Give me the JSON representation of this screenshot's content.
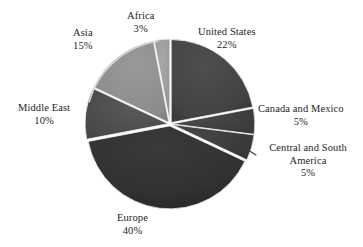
{
  "chart_data": {
    "type": "pie",
    "title": "",
    "subtitle": "",
    "xlabel": "",
    "ylabel": "",
    "legend_position": "none",
    "grid": false,
    "unit": "%",
    "style": "grayscale exploded pie with thin white separators",
    "background_color": "#ffffff",
    "label_text_color": "#1e1e1e",
    "categories": [
      "United States",
      "Canada and Mexico",
      "Central and South America",
      "Europe",
      "Middle East",
      "Asia",
      "Africa"
    ],
    "values": [
      22,
      5,
      5,
      40,
      10,
      15,
      3
    ],
    "slices": [
      {
        "label": "United States",
        "value": 22,
        "value_text": "22%",
        "color": "#434343",
        "start_angle": 0,
        "end_angle": 79.2
      },
      {
        "label": "Canada and Mexico",
        "value": 5,
        "value_text": "5%",
        "color": "#3f3f3f",
        "start_angle": 79.2,
        "end_angle": 97.2
      },
      {
        "label": "Central and South America",
        "value": 5,
        "value_text": "5%",
        "color": "#3b3b3b",
        "start_angle": 97.2,
        "end_angle": 115.2
      },
      {
        "label": "Europe",
        "value": 40,
        "value_text": "40%",
        "color": "#313131",
        "start_angle": 115.2,
        "end_angle": 259.2
      },
      {
        "label": "Middle East",
        "value": 10,
        "value_text": "10%",
        "color": "#4d4d4d",
        "start_angle": 259.2,
        "end_angle": 295.2
      },
      {
        "label": "Asia",
        "value": 15,
        "value_text": "15%",
        "color": "#8c8c8c",
        "start_angle": 295.2,
        "end_angle": 349.2
      },
      {
        "label": "Africa",
        "value": 3,
        "value_text": "3%",
        "color": "#9a9a9a",
        "start_angle": 349.2,
        "end_angle": 360
      }
    ]
  },
  "labels": {
    "united_states": {
      "name": "United States",
      "value": "22%"
    },
    "canada_mexico": {
      "name": "Canada and Mexico",
      "value": "5%"
    },
    "central_south_america": {
      "name": "Central and South America",
      "value": "5%"
    },
    "europe": {
      "name": "Europe",
      "value": "40%"
    },
    "middle_east": {
      "name": "Middle East",
      "value": "10%"
    },
    "asia": {
      "name": "Asia",
      "value": "15%"
    },
    "africa": {
      "name": "Africa",
      "value": "3%"
    }
  }
}
